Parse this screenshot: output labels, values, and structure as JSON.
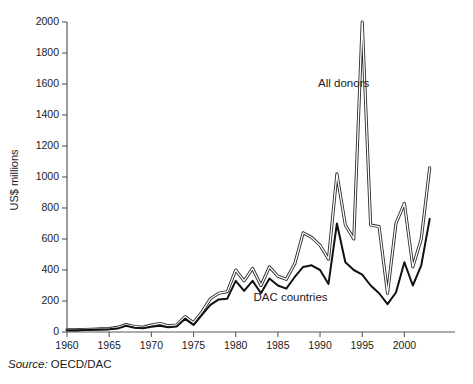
{
  "chart_data": {
    "type": "line",
    "title": "",
    "xlabel": "",
    "ylabel": "US$ millions",
    "xlim": [
      1960,
      2006
    ],
    "ylim": [
      0,
      2000
    ],
    "ytick_step": 200,
    "grid": false,
    "legend_position": "inline-annotations",
    "yticks": [
      0,
      200,
      400,
      600,
      800,
      1000,
      1200,
      1400,
      1600,
      1800,
      2000
    ],
    "ytick_labels": [
      "0",
      "200",
      "400",
      "600",
      "800",
      "1000",
      "1200",
      "1400",
      "1600",
      "1800",
      "2000"
    ],
    "xticks": [
      1960,
      1965,
      1970,
      1975,
      1980,
      1985,
      1990,
      1995,
      2000
    ],
    "xtick_labels": [
      "1960",
      "1965",
      "1970",
      "1975",
      "1980",
      "1985",
      "1990",
      "1995",
      "2000"
    ],
    "x": [
      1960,
      1961,
      1962,
      1963,
      1964,
      1965,
      1966,
      1967,
      1968,
      1969,
      1970,
      1971,
      1972,
      1973,
      1974,
      1975,
      1976,
      1977,
      1978,
      1979,
      1980,
      1981,
      1982,
      1983,
      1984,
      1985,
      1986,
      1987,
      1988,
      1989,
      1990,
      1991,
      1992,
      1993,
      1994,
      1995,
      1996,
      1997,
      1998,
      1999,
      2000,
      2001,
      2002,
      2003
    ],
    "series": [
      {
        "name": "All donors",
        "style": "outlined-double-line",
        "values": [
          15,
          14,
          16,
          18,
          20,
          22,
          30,
          48,
          36,
          30,
          45,
          55,
          40,
          45,
          100,
          60,
          130,
          215,
          250,
          260,
          400,
          330,
          410,
          300,
          420,
          360,
          340,
          440,
          640,
          610,
          560,
          470,
          1020,
          690,
          600,
          2000,
          690,
          680,
          250,
          700,
          830,
          420,
          600,
          1060
        ]
      },
      {
        "name": "DAC countries",
        "style": "solid-line",
        "values": [
          12,
          11,
          13,
          15,
          16,
          18,
          22,
          40,
          28,
          24,
          34,
          40,
          30,
          36,
          85,
          45,
          110,
          175,
          210,
          215,
          330,
          265,
          330,
          250,
          345,
          300,
          280,
          355,
          420,
          430,
          400,
          310,
          700,
          450,
          400,
          370,
          300,
          250,
          180,
          255,
          450,
          300,
          430,
          730
        ]
      }
    ],
    "annotations": [
      {
        "text": "All donors",
        "x": 1992.8,
        "y": 1580
      },
      {
        "text": "DAC countries",
        "x": 1986.5,
        "y": 200
      }
    ]
  },
  "source": {
    "keyword": "Source:",
    "value": "OECD/DAC"
  }
}
